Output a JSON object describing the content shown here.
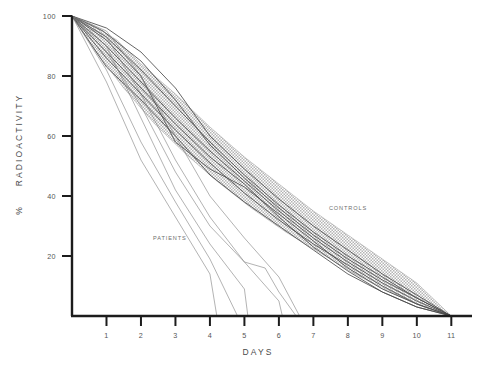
{
  "chart_data": {
    "type": "line",
    "title": "",
    "xlabel": "DAYS",
    "ylabel": "% RADIOACTIVITY",
    "xlim": [
      0,
      11.6
    ],
    "ylim": [
      0,
      100
    ],
    "xticks": [
      1,
      2,
      3,
      4,
      5,
      6,
      7,
      8,
      9,
      10,
      11
    ],
    "yticks": [
      20,
      40,
      60,
      80,
      100
    ],
    "grid": false,
    "legend_position": "inline-annotation",
    "annotations": [
      {
        "text": "CONTROLS",
        "x": 7.45,
        "y": 35.5
      },
      {
        "text": "PATIENTS",
        "x": 2.35,
        "y": 25.5
      }
    ],
    "band": {
      "name": "CONTROLS",
      "fill": "#d2d2d2",
      "upper": [
        [
          0,
          100
        ],
        [
          0.6,
          97
        ],
        [
          1.3,
          92
        ],
        [
          2,
          84
        ],
        [
          3,
          74
        ],
        [
          4,
          63
        ],
        [
          5,
          53
        ],
        [
          6,
          44
        ],
        [
          7,
          35
        ],
        [
          8,
          27
        ],
        [
          9,
          19
        ],
        [
          10,
          11
        ],
        [
          11,
          0
        ]
      ],
      "lower": [
        [
          0,
          100
        ],
        [
          0.7,
          88
        ],
        [
          1.5,
          76
        ],
        [
          2.4,
          64
        ],
        [
          3.3,
          54
        ],
        [
          4.2,
          45
        ],
        [
          5.2,
          36
        ],
        [
          6.2,
          28
        ],
        [
          7.2,
          21
        ],
        [
          8.2,
          14
        ],
        [
          9.2,
          8
        ],
        [
          10.2,
          3
        ],
        [
          11,
          0
        ]
      ]
    },
    "series": [
      {
        "name": "control-1",
        "group": "controls",
        "color": "#4a4a4a",
        "values": [
          [
            0,
            100
          ],
          [
            1,
            93
          ],
          [
            2,
            82
          ],
          [
            3,
            70
          ],
          [
            4,
            58
          ],
          [
            5,
            47
          ],
          [
            6,
            37
          ],
          [
            7,
            28
          ],
          [
            8,
            20
          ],
          [
            9,
            13
          ],
          [
            10,
            6
          ],
          [
            11,
            0
          ]
        ]
      },
      {
        "name": "control-2",
        "group": "controls",
        "color": "#4a4a4a",
        "values": [
          [
            0,
            100
          ],
          [
            1,
            90
          ],
          [
            2,
            78
          ],
          [
            3,
            66
          ],
          [
            4,
            55
          ],
          [
            5,
            45
          ],
          [
            6,
            35
          ],
          [
            7,
            26
          ],
          [
            8,
            18
          ],
          [
            9,
            11
          ],
          [
            10,
            5
          ],
          [
            11,
            0
          ]
        ]
      },
      {
        "name": "control-3",
        "group": "controls",
        "color": "#4a4a4a",
        "values": [
          [
            0,
            100
          ],
          [
            1,
            96
          ],
          [
            2,
            88
          ],
          [
            3,
            76
          ],
          [
            4,
            60
          ],
          [
            5,
            49
          ],
          [
            6,
            39
          ],
          [
            7,
            30
          ],
          [
            8,
            22
          ],
          [
            9,
            14
          ],
          [
            10,
            7
          ],
          [
            11,
            0
          ]
        ]
      },
      {
        "name": "control-4",
        "group": "controls",
        "color": "#4a4a4a",
        "values": [
          [
            0,
            100
          ],
          [
            1,
            86
          ],
          [
            2,
            74
          ],
          [
            3,
            62
          ],
          [
            4,
            51
          ],
          [
            5,
            41
          ],
          [
            6,
            32
          ],
          [
            7,
            24
          ],
          [
            8,
            17
          ],
          [
            9,
            10
          ],
          [
            10,
            4
          ],
          [
            11,
            0
          ]
        ]
      },
      {
        "name": "control-5",
        "group": "controls",
        "color": "#4a4a4a",
        "values": [
          [
            0,
            100
          ],
          [
            1,
            92
          ],
          [
            2,
            80
          ],
          [
            3,
            58
          ],
          [
            4,
            49
          ],
          [
            5,
            43
          ],
          [
            6,
            34
          ],
          [
            7,
            25
          ],
          [
            8,
            16
          ],
          [
            9,
            9
          ],
          [
            10,
            4
          ],
          [
            11,
            0
          ]
        ]
      },
      {
        "name": "control-6",
        "group": "controls",
        "color": "#4a4a4a",
        "values": [
          [
            0,
            100
          ],
          [
            0.9,
            95
          ],
          [
            2,
            85
          ],
          [
            3,
            72
          ],
          [
            4,
            57
          ],
          [
            5,
            46
          ],
          [
            6,
            36
          ],
          [
            7,
            27
          ],
          [
            8,
            19
          ],
          [
            9,
            12
          ],
          [
            10,
            6
          ],
          [
            11,
            0
          ]
        ]
      },
      {
        "name": "control-7",
        "group": "controls",
        "color": "#4a4a4a",
        "values": [
          [
            0,
            100
          ],
          [
            1,
            88
          ],
          [
            2,
            76
          ],
          [
            3,
            64
          ],
          [
            4,
            53
          ],
          [
            5,
            44
          ],
          [
            6,
            33
          ],
          [
            7,
            23
          ],
          [
            8,
            15
          ],
          [
            9,
            8
          ],
          [
            10,
            3
          ],
          [
            11,
            0
          ]
        ]
      },
      {
        "name": "control-8",
        "group": "controls",
        "color": "#4a4a4a",
        "values": [
          [
            0,
            100
          ],
          [
            1,
            83
          ],
          [
            2,
            72
          ],
          [
            3,
            60
          ],
          [
            4,
            47
          ],
          [
            5,
            38
          ],
          [
            6,
            30
          ],
          [
            7,
            22
          ],
          [
            8,
            14
          ],
          [
            9,
            8
          ],
          [
            10,
            3
          ],
          [
            11,
            0
          ]
        ]
      },
      {
        "name": "patient-1",
        "group": "patients",
        "color": "#808080",
        "values": [
          [
            0,
            100
          ],
          [
            1,
            78
          ],
          [
            2,
            52
          ],
          [
            3,
            33
          ],
          [
            4,
            14
          ],
          [
            4.2,
            0
          ]
        ]
      },
      {
        "name": "patient-2",
        "group": "patients",
        "color": "#808080",
        "values": [
          [
            0,
            100
          ],
          [
            1,
            82
          ],
          [
            2,
            58
          ],
          [
            3,
            38
          ],
          [
            4,
            19
          ],
          [
            4.8,
            0
          ]
        ]
      },
      {
        "name": "patient-3",
        "group": "patients",
        "color": "#808080",
        "values": [
          [
            0,
            100
          ],
          [
            1,
            90
          ],
          [
            2,
            66
          ],
          [
            3,
            42
          ],
          [
            4,
            24
          ],
          [
            5,
            9
          ],
          [
            5.1,
            0
          ]
        ]
      },
      {
        "name": "patient-4",
        "group": "patients",
        "color": "#808080",
        "values": [
          [
            0,
            100
          ],
          [
            1,
            93
          ],
          [
            2,
            74
          ],
          [
            3,
            52
          ],
          [
            4,
            33
          ],
          [
            5,
            18
          ],
          [
            6,
            5
          ],
          [
            6.1,
            0
          ]
        ]
      },
      {
        "name": "patient-5",
        "group": "patients",
        "color": "#808080",
        "values": [
          [
            0,
            100
          ],
          [
            1,
            88
          ],
          [
            2,
            70
          ],
          [
            3,
            48
          ],
          [
            4,
            30
          ],
          [
            5,
            18
          ],
          [
            5.6,
            16
          ],
          [
            6,
            8
          ],
          [
            6.5,
            0
          ]
        ]
      },
      {
        "name": "patient-6",
        "group": "patients",
        "color": "#808080",
        "values": [
          [
            0,
            100
          ],
          [
            1,
            95
          ],
          [
            2,
            80
          ],
          [
            3,
            60
          ],
          [
            4,
            40
          ],
          [
            5,
            26
          ],
          [
            6,
            13
          ],
          [
            6.6,
            0
          ]
        ]
      }
    ]
  },
  "axes": {
    "xlabel": "DAYS",
    "ylabel": "% RADIOACTIVITY",
    "ylabel_percent": "%",
    "ylabel_word": "RADIOACTIVITY"
  },
  "colors": {
    "axis": "#1c1c1c",
    "band_fill": "#d2d2d2",
    "control_line": "#4a4a4a",
    "patient_line": "#808080",
    "text": "#4a4a4a",
    "background": "#ffffff"
  }
}
